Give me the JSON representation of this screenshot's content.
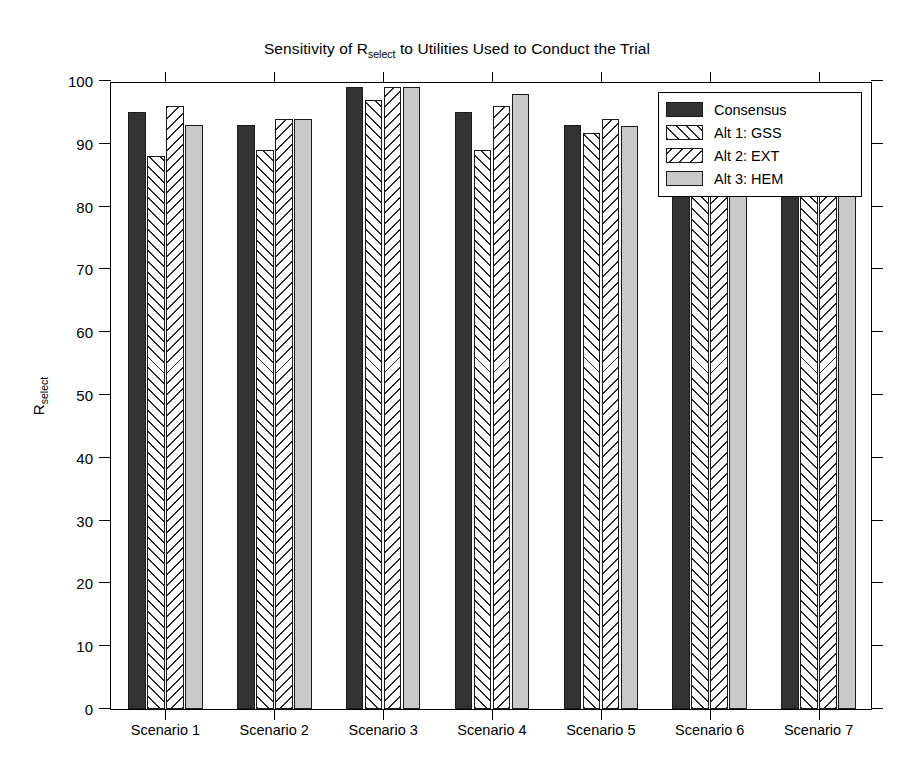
{
  "chart_data": {
    "type": "bar",
    "title_parts": {
      "pre": "Sensitivity of R",
      "sub": "select",
      "post": " to Utilities Used to Conduct the Trial"
    },
    "xlabel": "",
    "ylabel": "R_select",
    "ylabel_parts": {
      "base": "R",
      "sub": "select"
    },
    "ylim": [
      0,
      100
    ],
    "ytick_step": 10,
    "ytick_labels": [
      "0",
      "10",
      "20",
      "30",
      "40",
      "50",
      "60",
      "70",
      "80",
      "90",
      "100"
    ],
    "grid": false,
    "legend_position": "upper right",
    "categories": [
      "Scenario 1",
      "Scenario 2",
      "Scenario 3",
      "Scenario 4",
      "Scenario 5",
      "Scenario 6",
      "Scenario 7"
    ],
    "series": [
      {
        "name": "Consensus",
        "fill": "solid-dark",
        "color": "#333333",
        "values": [
          95,
          93,
          99,
          95,
          93,
          89,
          88
        ]
      },
      {
        "name": "Alt 1: GSS",
        "fill": "hatch-forward",
        "color": "#ffffff",
        "values": [
          88,
          89,
          97,
          89,
          91.8,
          90,
          86
        ]
      },
      {
        "name": "Alt 2: EXT",
        "fill": "hatch-backward",
        "color": "#ffffff",
        "values": [
          96,
          94,
          99,
          96,
          94,
          89,
          90
        ]
      },
      {
        "name": "Alt 3: HEM",
        "fill": "solid-light",
        "color": "#c9c9c9",
        "values": [
          93,
          94,
          99,
          98,
          92.8,
          90,
          83.7
        ]
      }
    ]
  },
  "legend": {
    "items": [
      {
        "label": "Consensus"
      },
      {
        "label": "Alt 1: GSS"
      },
      {
        "label": "Alt 2: EXT"
      },
      {
        "label": "Alt 3: HEM"
      }
    ]
  }
}
